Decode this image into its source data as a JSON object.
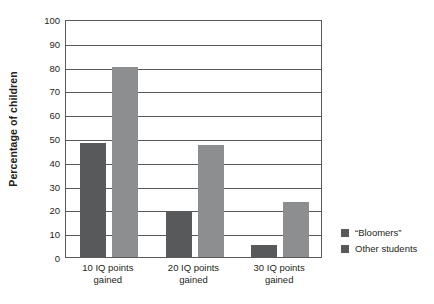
{
  "chart_data": {
    "type": "bar",
    "title": "",
    "xlabel": "",
    "ylabel": "Percentage of children",
    "categories": [
      "10 IQ points\ngained",
      "20 IQ points\ngained",
      "30 IQ points\ngained"
    ],
    "series": [
      {
        "name": "“Bloomers”",
        "values": [
          48,
          19,
          5
        ],
        "color": "#58595b"
      },
      {
        "name": "Other students",
        "values": [
          80,
          47,
          23
        ],
        "color": "#8d8e90"
      }
    ],
    "ylim": [
      0,
      100
    ],
    "ytick_labels": [
      "0",
      "10",
      "20",
      "30",
      "40",
      "50",
      "60",
      "70",
      "80",
      "90",
      "100"
    ],
    "ytick_values": [
      0,
      10,
      20,
      30,
      40,
      50,
      60,
      70,
      80,
      90,
      100
    ],
    "grid": true,
    "grid_axis": "y",
    "legend_position": "right"
  },
  "legend": {
    "items": [
      {
        "label": "“Bloomers”",
        "swatch": "legend-swatch-bloomers"
      },
      {
        "label": "Other students",
        "swatch": "legend-swatch-other-students"
      }
    ]
  }
}
